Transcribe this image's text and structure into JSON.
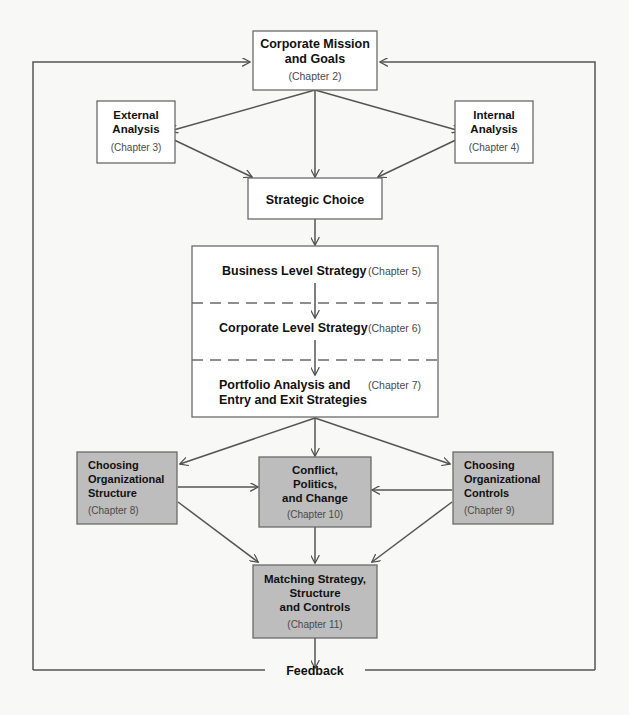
{
  "diagram": {
    "colors": {
      "shaded_fill": "#bdbdbd",
      "plain_fill": "#ffffff",
      "stroke": "#555555",
      "text": "#111111",
      "chapter_text": "#4a4a4a",
      "background": "#f8f8f7"
    },
    "boxes": [
      {
        "id": "corporate-mission-and-goals",
        "lines": [
          "Corporate Mission",
          "and Goals"
        ],
        "chapter": "(Chapter 2)",
        "shaded": false,
        "align": "center"
      },
      {
        "id": "external-analysis",
        "lines": [
          "External",
          "Analysis"
        ],
        "chapter": "(Chapter 3)",
        "shaded": false,
        "align": "center"
      },
      {
        "id": "internal-analysis",
        "lines": [
          "Internal",
          "Analysis"
        ],
        "chapter": "(Chapter 4)",
        "shaded": false,
        "align": "center"
      },
      {
        "id": "strategic-choice",
        "lines": [
          "Strategic Choice"
        ],
        "chapter": "",
        "shaded": false,
        "align": "center"
      },
      {
        "id": "choosing-organizational-structure",
        "lines": [
          "Choosing",
          "Organizational",
          "Structure"
        ],
        "chapter": "(Chapter 8)",
        "shaded": true,
        "align": "left"
      },
      {
        "id": "conflict-politics-and-change",
        "lines": [
          "Conflict,",
          "Politics,",
          "and Change"
        ],
        "chapter": "(Chapter 10)",
        "shaded": true,
        "align": "center"
      },
      {
        "id": "choosing-organizational-controls",
        "lines": [
          "Choosing",
          "Organizational",
          "Controls"
        ],
        "chapter": "(Chapter 9)",
        "shaded": true,
        "align": "left"
      },
      {
        "id": "matching-strategy-structure-and-controls",
        "lines": [
          "Matching Strategy,",
          "Structure",
          "and Controls"
        ],
        "chapter": "(Chapter 11)",
        "shaded": true,
        "align": "center"
      }
    ],
    "strategy_panel": {
      "id": "strategy-levels-panel",
      "rows": [
        {
          "id": "business-level-strategy",
          "lines": [
            "Business Level Strategy"
          ],
          "chapter": "(Chapter 5)"
        },
        {
          "id": "corporate-level-strategy",
          "lines": [
            "Corporate Level Strategy"
          ],
          "chapter": "(Chapter 6)"
        },
        {
          "id": "portfolio-analysis-and-entry-and-exit-strategies",
          "lines": [
            "Portfolio Analysis and",
            "Entry and Exit Strategies"
          ],
          "chapter": "(Chapter 7)"
        }
      ]
    },
    "feedback": {
      "id": "feedback-loop",
      "label": "Feedback"
    }
  }
}
